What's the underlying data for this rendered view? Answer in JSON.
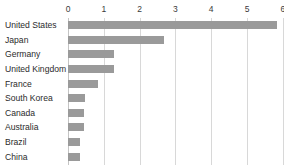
{
  "chart_data": {
    "type": "bar",
    "orientation": "horizontal",
    "title": "",
    "subtitle": "",
    "xlabel": "",
    "ylabel": "",
    "xlim": [
      0,
      6
    ],
    "grid": true,
    "legend": false,
    "legend_position": "none",
    "bar_color": "#9a9a9a",
    "gridline_color": "#d8d8d8",
    "background_color": "#ffffff",
    "text_color": "#2b2b2b",
    "xticks": [
      "0",
      "1",
      "2",
      "3",
      "4",
      "5",
      "6"
    ],
    "xtick_values": [
      0,
      1,
      2,
      3,
      4,
      5,
      6
    ],
    "categories": [
      "United States",
      "Japan",
      "Germany",
      "United Kingdom",
      "France",
      "South Korea",
      "Canada",
      "Australia",
      "Brazil",
      "China"
    ],
    "values": [
      5.85,
      2.68,
      1.28,
      1.28,
      0.85,
      0.47,
      0.45,
      0.45,
      0.33,
      0.33
    ]
  }
}
